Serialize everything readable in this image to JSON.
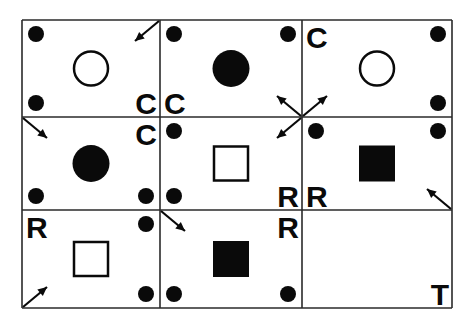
{
  "grid": {
    "cols": [
      22,
      160,
      302,
      452
    ],
    "rows": [
      20,
      117,
      210,
      308
    ],
    "line_color": "#2a2a2a",
    "ink": "#0a0a0a"
  },
  "cells": [
    {
      "row": 0,
      "col": 0,
      "shape": "circle-open",
      "dots": [
        "tl",
        "bl"
      ],
      "letters": [
        {
          "t": "C",
          "pos": "br"
        }
      ],
      "arrows": [
        "tr-in"
      ]
    },
    {
      "row": 0,
      "col": 1,
      "shape": "circle-filled",
      "dots": [
        "tl",
        "tr"
      ],
      "letters": [
        {
          "t": "C",
          "pos": "bl"
        }
      ],
      "arrows": [
        "br-in"
      ]
    },
    {
      "row": 0,
      "col": 2,
      "shape": "circle-open",
      "dots": [
        "tr",
        "br"
      ],
      "letters": [
        {
          "t": "C",
          "pos": "tl"
        }
      ],
      "arrows": [
        "bl-in"
      ]
    },
    {
      "row": 1,
      "col": 0,
      "shape": "circle-filled",
      "dots": [
        "bl",
        "br"
      ],
      "letters": [
        {
          "t": "C",
          "pos": "tr"
        }
      ],
      "arrows": [
        "tl-in"
      ]
    },
    {
      "row": 1,
      "col": 1,
      "shape": "square-open",
      "dots": [
        "tl",
        "bl"
      ],
      "letters": [
        {
          "t": "R",
          "pos": "br"
        }
      ],
      "arrows": [
        "tr-in"
      ]
    },
    {
      "row": 1,
      "col": 2,
      "shape": "square-filled",
      "dots": [
        "tl",
        "tr"
      ],
      "letters": [
        {
          "t": "R",
          "pos": "bl"
        }
      ],
      "arrows": [
        "br-in"
      ]
    },
    {
      "row": 2,
      "col": 0,
      "shape": "square-open",
      "dots": [
        "tr",
        "br"
      ],
      "letters": [
        {
          "t": "R",
          "pos": "tl"
        }
      ],
      "arrows": [
        "bl-in"
      ]
    },
    {
      "row": 2,
      "col": 1,
      "shape": "square-filled",
      "dots": [
        "bl",
        "br"
      ],
      "letters": [
        {
          "t": "R",
          "pos": "tr"
        }
      ],
      "arrows": [
        "tl-in"
      ]
    },
    {
      "row": 2,
      "col": 2,
      "shape": "none",
      "dots": [],
      "letters": [
        {
          "t": "T",
          "pos": "br"
        }
      ],
      "arrows": []
    }
  ]
}
